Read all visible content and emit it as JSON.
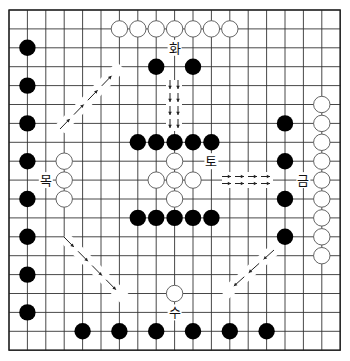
{
  "board": {
    "size": 19,
    "origin_x": 9,
    "origin_y": 10,
    "spacing_x": 18.4,
    "spacing_y": 18.9,
    "stone_radius": 8.2,
    "colors": {
      "black": "#000000",
      "white": "#ffffff",
      "line": "#333333"
    }
  },
  "stones": {
    "black": [
      [
        1,
        2
      ],
      [
        1,
        4
      ],
      [
        1,
        6
      ],
      [
        1,
        8
      ],
      [
        1,
        10
      ],
      [
        1,
        12
      ],
      [
        1,
        14
      ],
      [
        1,
        16
      ],
      [
        8,
        3
      ],
      [
        10,
        3
      ],
      [
        7,
        7
      ],
      [
        8,
        7
      ],
      [
        9,
        7
      ],
      [
        10,
        7
      ],
      [
        11,
        7
      ],
      [
        7,
        11
      ],
      [
        8,
        11
      ],
      [
        9,
        11
      ],
      [
        10,
        11
      ],
      [
        11,
        11
      ],
      [
        15,
        6
      ],
      [
        15,
        8
      ],
      [
        15,
        10
      ],
      [
        15,
        12
      ],
      [
        4,
        17
      ],
      [
        6,
        17
      ],
      [
        8,
        17
      ],
      [
        10,
        17
      ],
      [
        12,
        17
      ],
      [
        14,
        17
      ]
    ],
    "white": [
      [
        6,
        1
      ],
      [
        7,
        1
      ],
      [
        8,
        1
      ],
      [
        9,
        1
      ],
      [
        10,
        1
      ],
      [
        11,
        1
      ],
      [
        12,
        1
      ],
      [
        3,
        8
      ],
      [
        3,
        9
      ],
      [
        3,
        10
      ],
      [
        9,
        8
      ],
      [
        8,
        9
      ],
      [
        9,
        9
      ],
      [
        10,
        9
      ],
      [
        9,
        10
      ],
      [
        17,
        5
      ],
      [
        17,
        6
      ],
      [
        17,
        7
      ],
      [
        17,
        8
      ],
      [
        17,
        9
      ],
      [
        17,
        10
      ],
      [
        17,
        11
      ],
      [
        17,
        12
      ],
      [
        17,
        13
      ],
      [
        9,
        15
      ]
    ]
  },
  "labels": [
    {
      "id": "fire",
      "text": "화",
      "col": 9,
      "row": 2
    },
    {
      "id": "wood",
      "text": "목",
      "col": 2,
      "row": 9
    },
    {
      "id": "earth",
      "text": "토",
      "col": 11,
      "row": 8
    },
    {
      "id": "metal",
      "text": "금",
      "col": 16,
      "row": 9
    },
    {
      "id": "water",
      "text": "수",
      "col": 9,
      "row": 16
    }
  ],
  "arrows": [
    {
      "id": "wood-to-fire",
      "direction": "up-right",
      "from": [
        60,
        129
      ],
      "to": [
        121,
        66
      ],
      "double": false
    },
    {
      "id": "fire-to-earth",
      "direction": "down",
      "from": [
        174,
        80
      ],
      "to": [
        174,
        131
      ],
      "double": true,
      "offset": [
        -4,
        0
      ]
    },
    {
      "id": "earth-to-metal",
      "direction": "right",
      "from": [
        222,
        180
      ],
      "to": [
        273,
        180
      ],
      "double": true,
      "offset": [
        0,
        -3.5
      ]
    },
    {
      "id": "wood-to-water",
      "direction": "down-right",
      "from": [
        64,
        237
      ],
      "to": [
        127,
        301
      ],
      "double": false
    },
    {
      "id": "metal-to-water",
      "direction": "down-left",
      "from": [
        274,
        250
      ],
      "to": [
        224,
        295
      ],
      "double": false
    }
  ]
}
